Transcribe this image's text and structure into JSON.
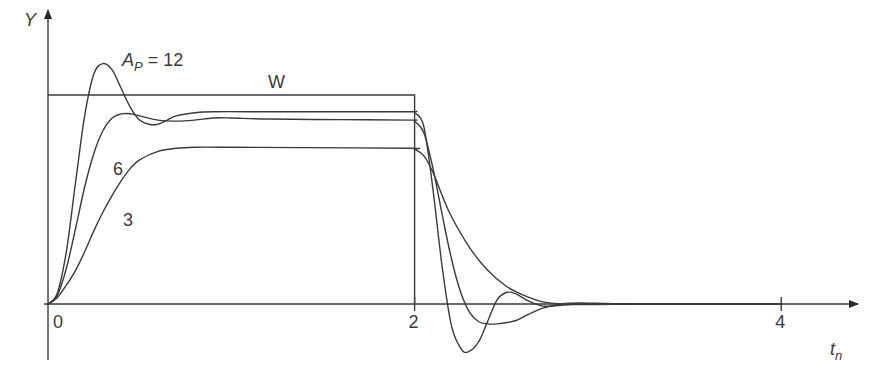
{
  "chart_data": {
    "type": "line",
    "title": "",
    "xlabel": "t",
    "xlabel_subscript": "n",
    "ylabel": "Y",
    "xlim": [
      0,
      4.4
    ],
    "ylim": [
      -0.3,
      1.3
    ],
    "x_ticks": [
      {
        "value": 0,
        "label": "0"
      },
      {
        "value": 2,
        "label": "2"
      },
      {
        "value": 4,
        "label": "4"
      }
    ],
    "grid": false,
    "reference": {
      "name": "W",
      "label": "W",
      "description": "rectangular setpoint pulse",
      "points": [
        [
          0,
          1.0
        ],
        [
          2.0,
          1.0
        ],
        [
          2.0,
          0
        ],
        [
          4.4,
          0
        ]
      ]
    },
    "series": [
      {
        "name": "A_P = 12",
        "label_main": "A",
        "label_sub": "P",
        "label_rest": " = 12",
        "points": [
          [
            0,
            0
          ],
          [
            0.05,
            0.05
          ],
          [
            0.1,
            0.25
          ],
          [
            0.15,
            0.58
          ],
          [
            0.2,
            0.9
          ],
          [
            0.25,
            1.1
          ],
          [
            0.3,
            1.15
          ],
          [
            0.35,
            1.12
          ],
          [
            0.4,
            1.03
          ],
          [
            0.45,
            0.94
          ],
          [
            0.5,
            0.88
          ],
          [
            0.55,
            0.86
          ],
          [
            0.6,
            0.86
          ],
          [
            0.65,
            0.88
          ],
          [
            0.7,
            0.9
          ],
          [
            0.8,
            0.915
          ],
          [
            0.9,
            0.92
          ],
          [
            1.2,
            0.92
          ],
          [
            1.6,
            0.92
          ],
          [
            1.98,
            0.92
          ],
          [
            2.0,
            0.915
          ],
          [
            2.05,
            0.85
          ],
          [
            2.1,
            0.55
          ],
          [
            2.15,
            0.18
          ],
          [
            2.2,
            -0.1
          ],
          [
            2.25,
            -0.21
          ],
          [
            2.29,
            -0.23
          ],
          [
            2.35,
            -0.18
          ],
          [
            2.4,
            -0.08
          ],
          [
            2.45,
            0.02
          ],
          [
            2.5,
            0.055
          ],
          [
            2.55,
            0.05
          ],
          [
            2.62,
            0.015
          ],
          [
            2.7,
            -0.01
          ],
          [
            2.8,
            -0.006
          ],
          [
            2.9,
            0.0
          ],
          [
            3.2,
            0.0
          ],
          [
            4.0,
            0.0
          ]
        ]
      },
      {
        "name": "A_P = 6",
        "label": "6",
        "points": [
          [
            0,
            0
          ],
          [
            0.05,
            0.04
          ],
          [
            0.1,
            0.17
          ],
          [
            0.15,
            0.36
          ],
          [
            0.2,
            0.56
          ],
          [
            0.25,
            0.72
          ],
          [
            0.3,
            0.83
          ],
          [
            0.35,
            0.89
          ],
          [
            0.4,
            0.91
          ],
          [
            0.45,
            0.91
          ],
          [
            0.5,
            0.9
          ],
          [
            0.6,
            0.88
          ],
          [
            0.7,
            0.875
          ],
          [
            0.8,
            0.88
          ],
          [
            0.9,
            0.89
          ],
          [
            1.0,
            0.89
          ],
          [
            1.2,
            0.885
          ],
          [
            1.6,
            0.882
          ],
          [
            1.98,
            0.88
          ],
          [
            2.0,
            0.875
          ],
          [
            2.05,
            0.82
          ],
          [
            2.1,
            0.65
          ],
          [
            2.15,
            0.43
          ],
          [
            2.2,
            0.22
          ],
          [
            2.25,
            0.06
          ],
          [
            2.3,
            -0.04
          ],
          [
            2.35,
            -0.085
          ],
          [
            2.4,
            -0.095
          ],
          [
            2.45,
            -0.095
          ],
          [
            2.55,
            -0.08
          ],
          [
            2.62,
            -0.05
          ],
          [
            2.7,
            -0.02
          ],
          [
            2.8,
            0.0
          ],
          [
            2.9,
            0.005
          ],
          [
            3.2,
            0.0
          ],
          [
            4.0,
            0.0
          ]
        ]
      },
      {
        "name": "A_P = 3",
        "label": "3",
        "points": [
          [
            0,
            0
          ],
          [
            0.05,
            0.03
          ],
          [
            0.1,
            0.09
          ],
          [
            0.15,
            0.16
          ],
          [
            0.2,
            0.25
          ],
          [
            0.25,
            0.35
          ],
          [
            0.3,
            0.44
          ],
          [
            0.35,
            0.52
          ],
          [
            0.4,
            0.59
          ],
          [
            0.45,
            0.65
          ],
          [
            0.5,
            0.69
          ],
          [
            0.6,
            0.73
          ],
          [
            0.7,
            0.745
          ],
          [
            0.8,
            0.75
          ],
          [
            1.0,
            0.75
          ],
          [
            1.4,
            0.748
          ],
          [
            1.98,
            0.745
          ],
          [
            2.0,
            0.74
          ],
          [
            2.05,
            0.71
          ],
          [
            2.1,
            0.63
          ],
          [
            2.15,
            0.52
          ],
          [
            2.2,
            0.42
          ],
          [
            2.3,
            0.27
          ],
          [
            2.4,
            0.16
          ],
          [
            2.5,
            0.085
          ],
          [
            2.6,
            0.04
          ],
          [
            2.7,
            0.01
          ],
          [
            2.8,
            0.0
          ],
          [
            2.9,
            -0.003
          ],
          [
            3.2,
            0.0
          ],
          [
            4.0,
            0.0
          ]
        ]
      }
    ]
  }
}
